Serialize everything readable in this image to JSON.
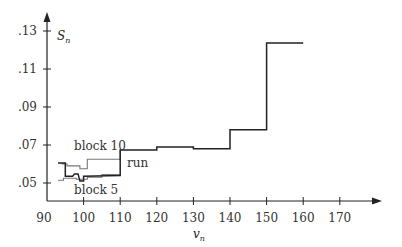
{
  "chart_data": {
    "type": "line",
    "step": true,
    "title": "",
    "xlabel": "v_n",
    "ylabel": "S_n",
    "xlim": [
      90,
      177
    ],
    "ylim": [
      0.0405,
      0.137
    ],
    "x_ticks": [
      90,
      100,
      110,
      120,
      130,
      140,
      150,
      160,
      170
    ],
    "x_tick_labels": [
      "90",
      "100",
      "110",
      "120",
      "130",
      "140",
      "150",
      "160",
      "170"
    ],
    "y_ticks": [
      0.05,
      0.07,
      0.09,
      0.11,
      0.13
    ],
    "y_tick_labels": [
      ".05",
      ".07",
      ".09",
      ".11",
      ".13"
    ],
    "grid": false,
    "legend": "inline labels",
    "series": [
      {
        "name": "run",
        "color": "#222222",
        "x": [
          93,
          95,
          95,
          97,
          97.5,
          98.5,
          99,
          100,
          100,
          110,
          110,
          120,
          120,
          130,
          130,
          140,
          140,
          150,
          150,
          160
        ],
        "y": [
          0.0605,
          0.0605,
          0.0535,
          0.0535,
          0.0548,
          0.0548,
          0.051,
          0.051,
          0.0535,
          0.054,
          0.0674,
          0.0674,
          0.069,
          0.069,
          0.068,
          0.068,
          0.078,
          0.078,
          0.1237,
          0.1237
        ]
      },
      {
        "name": "block 10",
        "color": "#777777",
        "x": [
          94,
          95.5,
          95.5,
          99,
          99,
          101,
          101,
          110,
          110
        ],
        "y": [
          0.06,
          0.06,
          0.059,
          0.059,
          0.0575,
          0.0575,
          0.0625,
          0.0625,
          0.0674
        ]
      },
      {
        "name": "block 5",
        "color": "#777777",
        "x": [
          93,
          94.5,
          94.5,
          98,
          98,
          101,
          101,
          105,
          105,
          110
        ],
        "y": [
          0.0515,
          0.0515,
          0.0525,
          0.0525,
          0.052,
          0.052,
          0.053,
          0.053,
          0.0545,
          0.0545
        ]
      }
    ],
    "annotations": [
      {
        "text": "block 10",
        "x": 97,
        "y": 0.0635
      },
      {
        "text": "run",
        "x": 112,
        "y": 0.0585
      },
      {
        "text": "block 5",
        "x": 97,
        "y": 0.0475
      }
    ]
  },
  "labels": {
    "y_axis": "S",
    "y_axis_sub": "n",
    "x_axis": "v",
    "x_axis_sub": "n",
    "run": "run",
    "block10": "block 10",
    "block5": "block 5"
  }
}
